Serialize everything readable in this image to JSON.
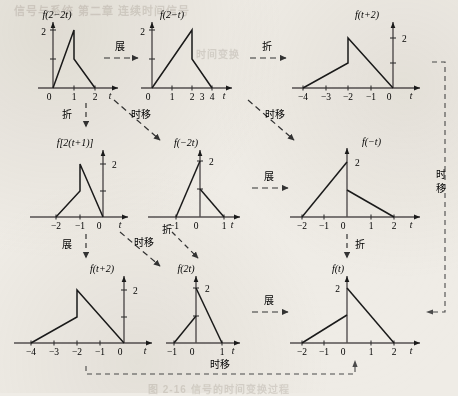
{
  "figure": {
    "kind": "signal-transformation-flow-diagram",
    "background_color": "#efece6",
    "ink_color": "#1a1a1a",
    "axis_color": "#555050",
    "dashed_color": "#4a4a4a"
  },
  "labels": {
    "expand": "展",
    "fold": "折",
    "time_shift": "时移",
    "axis_t": "t",
    "value_two": "2",
    "zero": "0",
    "tick_1": "1",
    "tick_2": "2",
    "tick_3": "3",
    "tick_4": "4",
    "tick_m1": "−1",
    "tick_m2": "−2",
    "tick_m3": "−3",
    "tick_m4": "−4"
  },
  "panels": [
    {
      "id": "p1",
      "title": "f(2−2t)",
      "row": 1,
      "col": 1,
      "xticks": [
        "0",
        "1",
        "2"
      ],
      "xtick_values": [
        0,
        1,
        2
      ],
      "peak_value": 2,
      "peak_at": 1,
      "breakpoints": [
        [
          0,
          0
        ],
        [
          1,
          2
        ],
        [
          1,
          1
        ],
        [
          2,
          0
        ]
      ],
      "xrange": [
        0,
        2.6
      ],
      "axis_label": "t",
      "ylabel": "2"
    },
    {
      "id": "p2",
      "title": "f(2−t)",
      "row": 1,
      "col": 2,
      "xticks": [
        "0",
        "1",
        "2",
        "3",
        "4"
      ],
      "xtick_values": [
        0,
        1,
        2,
        3,
        4
      ],
      "peak_value": 2,
      "peak_at": 2,
      "breakpoints": [
        [
          0,
          0
        ],
        [
          2,
          2
        ],
        [
          2,
          1
        ],
        [
          4,
          0
        ]
      ],
      "xrange": [
        0,
        5.2
      ],
      "axis_label": "t",
      "ylabel": "2"
    },
    {
      "id": "p3",
      "title": "f(t+2)",
      "row": 1,
      "col": 3,
      "xticks": [
        "−4",
        "−3",
        "−2",
        "−1",
        "0"
      ],
      "xtick_values": [
        -4,
        -3,
        -2,
        -1,
        0
      ],
      "peak_value": 2,
      "peak_at": -2,
      "breakpoints": [
        [
          -4,
          0
        ],
        [
          -2,
          1
        ],
        [
          -2,
          2
        ],
        [
          0,
          0
        ]
      ],
      "xrange": [
        -4.6,
        0.9
      ],
      "axis_label": "t",
      "ylabel": "2"
    },
    {
      "id": "p4",
      "title": "f[2(t+1)]",
      "row": 2,
      "col": 1,
      "xticks": [
        "−2",
        "−1",
        "0"
      ],
      "xtick_values": [
        -2,
        -1,
        0
      ],
      "peak_value": 2,
      "peak_at": -1,
      "breakpoints": [
        [
          -2,
          0
        ],
        [
          -1,
          1
        ],
        [
          -1,
          2
        ],
        [
          0,
          0
        ]
      ],
      "xrange": [
        -2.6,
        0.9
      ],
      "axis_label": "t",
      "ylabel": "2"
    },
    {
      "id": "p5",
      "title": "f(−2t)",
      "row": 2,
      "col": 2,
      "xticks": [
        "−1",
        "0",
        "1"
      ],
      "xtick_values": [
        -1,
        0,
        1
      ],
      "peak_value": 2,
      "peak_at": 0,
      "breakpoints": [
        [
          -1,
          0
        ],
        [
          0,
          2
        ],
        [
          0,
          1
        ],
        [
          1,
          0
        ]
      ],
      "xrange": [
        -1.5,
        1.8
      ],
      "axis_label": "t",
      "ylabel": "2"
    },
    {
      "id": "p6",
      "title": "f(−t)",
      "row": 2,
      "col": 3,
      "xticks": [
        "−2",
        "−1",
        "0",
        "1",
        "2"
      ],
      "xtick_values": [
        -2,
        -1,
        0,
        1,
        2
      ],
      "peak_value": 2,
      "peak_at": 0,
      "breakpoints": [
        [
          -2,
          0
        ],
        [
          0,
          2
        ],
        [
          0,
          1
        ],
        [
          2,
          0
        ]
      ],
      "xrange": [
        -2.6,
        2.8
      ],
      "axis_label": "t",
      "ylabel": "2"
    },
    {
      "id": "p7",
      "title": "f(t+2)",
      "row": 3,
      "col": 1,
      "xticks": [
        "−4",
        "−3",
        "−2",
        "−1",
        "0"
      ],
      "xtick_values": [
        -4,
        -3,
        -2,
        -1,
        0
      ],
      "peak_value": 2,
      "peak_at": -2,
      "breakpoints": [
        [
          -4,
          0
        ],
        [
          -2,
          1
        ],
        [
          -2,
          2
        ],
        [
          0,
          0
        ]
      ],
      "xrange": [
        -4.6,
        0.9
      ],
      "axis_label": "t",
      "ylabel": "2"
    },
    {
      "id": "p8",
      "title": "f(2t)",
      "row": 3,
      "col": 2,
      "xticks": [
        "−1",
        "0",
        "1"
      ],
      "xtick_values": [
        -1,
        0,
        1
      ],
      "peak_value": 2,
      "peak_at": 0,
      "breakpoints": [
        [
          -1,
          0
        ],
        [
          0,
          1
        ],
        [
          0,
          2
        ],
        [
          1,
          0
        ]
      ],
      "xrange": [
        -1.5,
        1.8
      ],
      "axis_label": "t",
      "ylabel": "2"
    },
    {
      "id": "p9",
      "title": "f(t)",
      "row": 3,
      "col": 3,
      "xticks": [
        "−2",
        "−1",
        "0",
        "1",
        "2"
      ],
      "xtick_values": [
        -2,
        -1,
        0,
        1,
        2
      ],
      "peak_value": 2,
      "peak_at": 0,
      "breakpoints": [
        [
          -2,
          0
        ],
        [
          0,
          1
        ],
        [
          0,
          2
        ],
        [
          2,
          0
        ]
      ],
      "xrange": [
        -2.6,
        2.8
      ],
      "axis_label": "t",
      "ylabel": "2"
    }
  ],
  "arrows": [
    {
      "id": "a1",
      "label": "展",
      "from": "p2",
      "to": "p1",
      "orientation": "horizontal"
    },
    {
      "id": "a2",
      "label": "折",
      "from": "p3",
      "to": "p2",
      "orientation": "horizontal"
    },
    {
      "id": "a3",
      "label": "折",
      "from": "p1",
      "to": "p4",
      "orientation": "vertical"
    },
    {
      "id": "a4",
      "label": "时移",
      "from": "p1",
      "to": "p5",
      "orientation": "diagonal"
    },
    {
      "id": "a5",
      "label": "时移",
      "from": "p2",
      "to": "p6",
      "orientation": "diagonal"
    },
    {
      "id": "a6",
      "label": "展",
      "from": "p5",
      "to": "p6",
      "orientation": "horizontal"
    },
    {
      "id": "a7",
      "label": "展",
      "from": "p4",
      "to": "p7",
      "orientation": "vertical"
    },
    {
      "id": "a8",
      "label": "时移",
      "from": "p4",
      "to": "p8",
      "orientation": "diagonal"
    },
    {
      "id": "a9",
      "label": "折",
      "from": "p5",
      "to": "p8",
      "orientation": "diagonal"
    },
    {
      "id": "a10",
      "label": "折",
      "from": "p6",
      "to": "p9",
      "orientation": "vertical"
    },
    {
      "id": "a11",
      "label": "展",
      "from": "p8",
      "to": "p9",
      "orientation": "horizontal"
    },
    {
      "id": "a12",
      "label": "时移",
      "from": "p9",
      "to": "p7",
      "orientation": "bracket-bottom"
    },
    {
      "id": "a13",
      "label": "时移",
      "from": "p3",
      "to": "p9",
      "orientation": "bracket-right"
    }
  ],
  "bleed_text": {
    "top": "信号与系统 第二章 连续时间信号",
    "mid": "时间变换",
    "bottom": "图 2-16  信号的时间变换过程"
  }
}
